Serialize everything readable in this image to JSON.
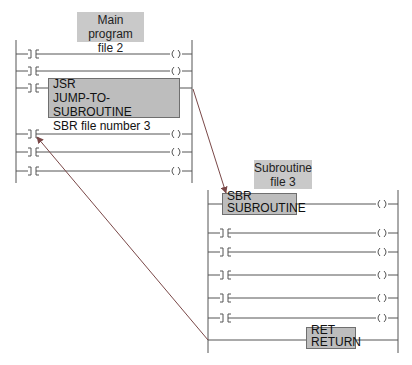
{
  "main_program": {
    "label_line1": "Main program",
    "label_line2": "file 2",
    "jsr": {
      "mnemonic": "JSR",
      "name": "JUMP-TO-SUBROUTINE",
      "parameter": "SBR file number 3"
    },
    "rung_count": 6
  },
  "subroutine": {
    "label_line1": "Subroutine",
    "label_line2": "file 3",
    "sbr": {
      "mnemonic": "SBR",
      "name": "SUBROUTINE"
    },
    "ret": {
      "mnemonic": "RET",
      "name": "RETURN"
    },
    "rung_count": 7
  },
  "colors": {
    "line": "#555555",
    "label_fill": "#c9c9c9",
    "box_fill": "#bdbdbd",
    "arrow": "#8a4a4a"
  }
}
